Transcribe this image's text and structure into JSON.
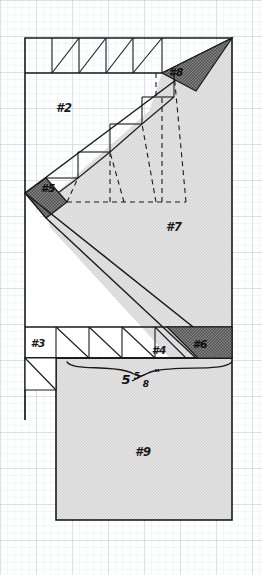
{
  "document": {
    "title": "Cutting Layout Diagram",
    "medium": "graph-paper",
    "background_color": "#ffffff",
    "grid_color": "#c9d3dc",
    "ink_color": "#1a1a1a"
  },
  "canvas": {
    "width": 262,
    "height": 575
  },
  "grid": {
    "minor_spacing": 7.2,
    "major_every": 5,
    "minor_color": "#d8e0e8",
    "major_color": "#b9c6d2",
    "visible": true
  },
  "fills": {
    "light_hatch": "#dcdcdc",
    "dark_hatch": "#6e6e6e",
    "white": "#ffffff"
  },
  "outline": {
    "left": 25,
    "right": 232,
    "top": 38,
    "bottom": 520,
    "stroke": "#1a1a1a",
    "stroke_width": 1.6
  },
  "labels": [
    {
      "id": "p2",
      "text": "#2",
      "x": 64,
      "y": 108,
      "size": 11,
      "tone": "dark-on-white"
    },
    {
      "id": "p8",
      "text": "#8",
      "x": 174,
      "y": 74,
      "size": 10,
      "tone": "dark-on-shade"
    },
    {
      "id": "p5",
      "text": "#5",
      "x": 48,
      "y": 187,
      "size": 10,
      "tone": "dark-on-shade"
    },
    {
      "id": "p7",
      "text": "#7",
      "x": 172,
      "y": 227,
      "size": 11,
      "tone": "dark-on-white"
    },
    {
      "id": "p3",
      "text": "#3",
      "x": 35,
      "y": 343,
      "size": 10,
      "tone": "dark-on-white"
    },
    {
      "id": "p4",
      "text": "#4",
      "x": 157,
      "y": 350,
      "size": 10,
      "tone": "dark-on-white"
    },
    {
      "id": "p6",
      "text": "#6",
      "x": 196,
      "y": 344,
      "size": 10,
      "tone": "dark-on-shade"
    },
    {
      "id": "p9",
      "text": "#9",
      "x": 141,
      "y": 452,
      "size": 11,
      "tone": "dark-on-white"
    }
  ],
  "dimension": {
    "name": "width-dimension",
    "whole": "5",
    "numerator": "5",
    "denominator": "8",
    "unit": "\"",
    "full_text": "5 5/8\"",
    "brace": {
      "left": 67,
      "right": 232,
      "y": 362,
      "depth": 9
    },
    "text_x": 140,
    "text_y": 381
  },
  "pieces": [
    {
      "id": "piece-2",
      "label": "#2",
      "shading": "white",
      "note": "large upper-left triangle block"
    },
    {
      "id": "piece-3",
      "label": "#3",
      "shading": "white",
      "note": "small left rectangle in lower band"
    },
    {
      "id": "piece-4",
      "label": "#4",
      "shading": "white",
      "note": "half-square triangle in lower band"
    },
    {
      "id": "piece-5",
      "label": "#5",
      "shading": "dark-hatch",
      "note": "dark diamond at mid-left"
    },
    {
      "id": "piece-6",
      "label": "#6",
      "shading": "dark-hatch",
      "note": "dark parallelogram at lower right"
    },
    {
      "id": "piece-7",
      "label": "#7",
      "shading": "light-hatch",
      "note": "large shaded right triangle"
    },
    {
      "id": "piece-8",
      "label": "#8",
      "shading": "dark-hatch",
      "note": "dark triangle at upper right"
    },
    {
      "id": "piece-9",
      "label": "#9",
      "shading": "light-hatch",
      "note": "large shaded bottom rectangle"
    }
  ],
  "strip_top": {
    "name": "top-triangle-strip",
    "y_top": 38,
    "y_bottom": 73,
    "x_start": 25,
    "x_end": 162,
    "cells": 5,
    "diagonal_direction": "bottom-left-to-top-right"
  },
  "strip_bottom": {
    "name": "bottom-triangle-strip",
    "y_top": 327,
    "y_bottom": 358,
    "x_start": 25,
    "x_end": 232,
    "cells": 6,
    "diagonal_direction": "top-left-to-bottom-right"
  },
  "staircase": {
    "name": "staircase-triangles",
    "steps": 4,
    "note": "nested half-square triangles along the main diagonal"
  },
  "dashed_lines": {
    "name": "construction-lines",
    "stroke": "#1a1a1a",
    "dash": "5 4",
    "count": 5,
    "note": "fan of dashed seam/fold guides inside piece #7"
  }
}
